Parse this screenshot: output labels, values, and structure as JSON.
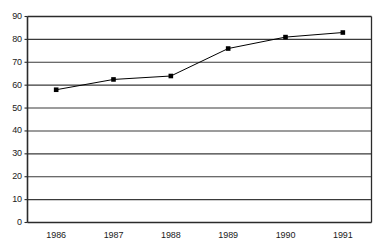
{
  "chart_data": {
    "type": "line",
    "title": "",
    "subtitle": "",
    "xlabel": "",
    "ylabel": "",
    "categories": [
      "1986",
      "1987",
      "1988",
      "1989",
      "1990",
      "1991"
    ],
    "x": [
      1986,
      1987,
      1988,
      1989,
      1990,
      1991
    ],
    "series": [
      {
        "name": "series-1",
        "values": [
          58,
          62.5,
          64,
          76,
          81,
          83
        ],
        "color": "#000000",
        "marker": "square",
        "line_width": 1
      }
    ],
    "ylim": [
      0,
      90
    ],
    "ytick_values": [
      0,
      10,
      20,
      30,
      40,
      50,
      60,
      70,
      80,
      90
    ],
    "ytick_labels": [
      "0",
      "10",
      "20",
      "30",
      "40",
      "50",
      "60",
      "70",
      "80",
      "90"
    ],
    "xtick_labels": [
      "1986",
      "1987",
      "1988",
      "1989",
      "1990",
      "1991"
    ],
    "grid": {
      "horizontal": true,
      "vertical": false,
      "color": "#3a3a3a"
    },
    "legend": {
      "visible": false,
      "position": "none",
      "entries": []
    },
    "axis": {
      "frame": true,
      "frame_color": "#2b2b2b",
      "tick_marks": true,
      "background": "#ffffff"
    },
    "annotations": []
  },
  "figure": {
    "title_fragment": "",
    "background_color": "#ffffff"
  }
}
